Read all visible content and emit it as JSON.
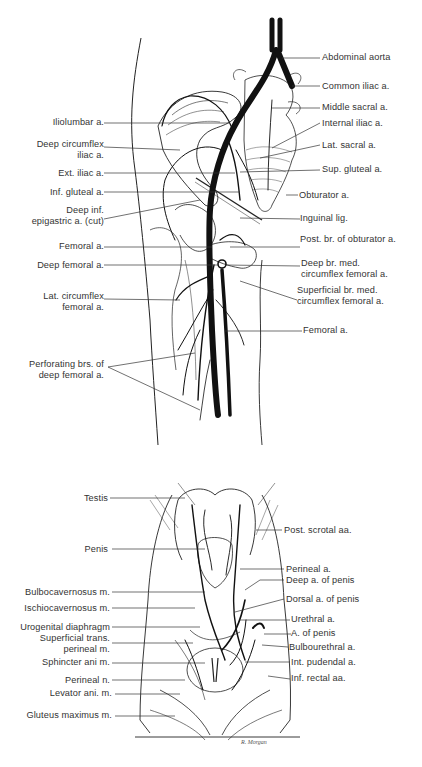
{
  "figure_top": {
    "title": "Arteries of pelvis and thigh",
    "labels_left": [
      {
        "id": "iliolumbar",
        "text": "Iliolumbar a."
      },
      {
        "id": "deep-circumflex-iliac",
        "text": "Deep circumflex\niliac a."
      },
      {
        "id": "ext-iliac",
        "text": "Ext. iliac a."
      },
      {
        "id": "inf-gluteal",
        "text": "Inf. gluteal a."
      },
      {
        "id": "deep-inf-epigastric",
        "text": "Deep inf.\nepigastric a. (cut)"
      },
      {
        "id": "femoral-left",
        "text": "Femoral a."
      },
      {
        "id": "deep-femoral",
        "text": "Deep femoral a."
      },
      {
        "id": "lat-circumflex-femoral",
        "text": "Lat. circumflex\nfemoral a."
      },
      {
        "id": "perforating-brs",
        "text": "Perforating brs. of\ndeep femoral a."
      }
    ],
    "labels_right": [
      {
        "id": "abdominal-aorta",
        "text": "Abdominal aorta"
      },
      {
        "id": "common-iliac",
        "text": "Common iliac a."
      },
      {
        "id": "middle-sacral",
        "text": "Middle sacral a."
      },
      {
        "id": "internal-iliac",
        "text": "Internal iliac a."
      },
      {
        "id": "lat-sacral",
        "text": "Lat. sacral a."
      },
      {
        "id": "sup-gluteal",
        "text": "Sup. gluteal a."
      },
      {
        "id": "obturator",
        "text": "Obturator a."
      },
      {
        "id": "inguinal-lig",
        "text": "Inguinal lig."
      },
      {
        "id": "post-br-obturator",
        "text": "Post. br. of obturator a."
      },
      {
        "id": "deep-br-med-circumflex",
        "text": "Deep br. med.\ncircumflex femoral a."
      },
      {
        "id": "superficial-br-med-circumflex",
        "text": "Superficial br. med.\ncircumflex femoral a."
      },
      {
        "id": "femoral-right",
        "text": "Femoral a."
      }
    ]
  },
  "figure_bottom": {
    "title": "Perineum arteries",
    "labels_left": [
      {
        "id": "testis",
        "text": "Testis"
      },
      {
        "id": "penis",
        "text": "Penis"
      },
      {
        "id": "bulbocavernosus",
        "text": "Bulbocavernosus m."
      },
      {
        "id": "ischiocavernosus",
        "text": "Ischiocavernosus m."
      },
      {
        "id": "urogenital-diaphragm",
        "text": "Urogenital diaphragm"
      },
      {
        "id": "superficial-trans-perineal",
        "text": "Superficial trans.\nperineal m."
      },
      {
        "id": "sphincter-ani",
        "text": "Sphincter ani m."
      },
      {
        "id": "perineal-n",
        "text": "Perineal n."
      },
      {
        "id": "levator-ani",
        "text": "Levator ani. m."
      },
      {
        "id": "gluteus-maximus",
        "text": "Gluteus maximus m."
      }
    ],
    "labels_right": [
      {
        "id": "post-scrotal",
        "text": "Post. scrotal aa."
      },
      {
        "id": "perineal-a",
        "text": "Perineal a."
      },
      {
        "id": "deep-a-penis",
        "text": "Deep a. of penis"
      },
      {
        "id": "dorsal-a-penis",
        "text": "Dorsal a. of penis"
      },
      {
        "id": "urethral",
        "text": "Urethral a."
      },
      {
        "id": "a-of-penis",
        "text": "A. of penis"
      },
      {
        "id": "bulbourethral",
        "text": "Bulbourethral a."
      },
      {
        "id": "int-pudendal",
        "text": "Int. pudendal a."
      },
      {
        "id": "inf-rectal",
        "text": "Inf. rectal aa."
      }
    ],
    "signature": "R. Morgan"
  }
}
